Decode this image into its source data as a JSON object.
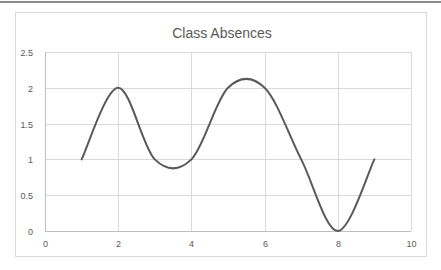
{
  "chart_data": {
    "type": "scatter",
    "subtype": "smooth-line",
    "title": "Class Absences",
    "xlabel": "",
    "ylabel": "",
    "x": [
      1,
      2,
      3,
      4,
      5,
      6,
      7,
      8,
      9
    ],
    "series": [
      {
        "name": "Absences",
        "values": [
          1,
          2,
          1,
          1,
          2,
          2,
          1,
          0,
          1
        ],
        "color": "#595959"
      }
    ],
    "xlim": [
      0,
      10
    ],
    "ylim": [
      0,
      2.5
    ],
    "xticks": [
      0,
      2,
      4,
      6,
      8,
      10
    ],
    "yticks": [
      0,
      0.5,
      1,
      1.5,
      2,
      2.5
    ],
    "xtick_labels": [
      "0",
      "2",
      "4",
      "6",
      "8",
      "10"
    ],
    "ytick_labels": [
      "0",
      "0.5",
      "1",
      "1.5",
      "2",
      "2.5"
    ],
    "grid": true,
    "legend": "none"
  },
  "colors": {
    "series": "#595959",
    "grid": "#d9d9d9",
    "text": "#595959",
    "border": "#d9d9d9"
  }
}
